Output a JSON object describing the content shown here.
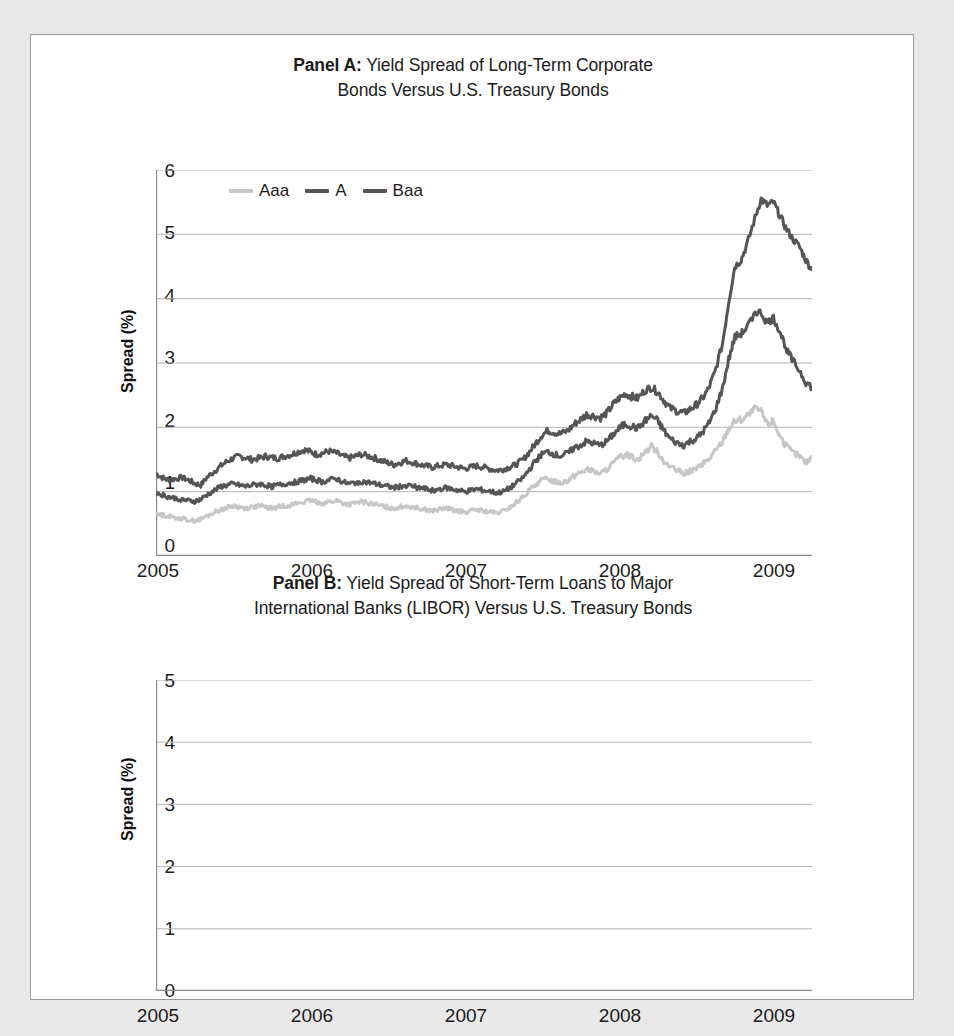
{
  "figure": {
    "background_color": "#e9e9e9",
    "frame_color": "#9a9a9a",
    "axis_color": "#8a8a8a",
    "grid_color": "#b5b5b5"
  },
  "panel_a": {
    "title_bold": "Panel A:",
    "title_rest": " Yield Spread of Long-Term Corporate",
    "title_line2": "Bonds Versus U.S. Treasury Bonds",
    "ylabel": "Spread (%)",
    "yticks": [
      "0",
      "1",
      "2",
      "3",
      "4",
      "5",
      "6"
    ],
    "xticks": [
      "2005",
      "2006",
      "2007",
      "2008",
      "2009"
    ],
    "legend": [
      {
        "label": "Aaa",
        "color": "#c7c7c7"
      },
      {
        "label": "A",
        "color": "#555555"
      },
      {
        "label": "Baa",
        "color": "#555555"
      }
    ]
  },
  "panel_b": {
    "title_bold": "Panel B:",
    "title_rest": " Yield Spread of Short-Term Loans to Major",
    "title_line2": "International Banks (LIBOR) Versus U.S. Treasury Bonds",
    "ylabel": "Spread (%)",
    "yticks": [
      "0",
      "1",
      "2",
      "3",
      "4",
      "5"
    ],
    "xticks": [
      "2005",
      "2006",
      "2007",
      "2008",
      "2009"
    ]
  },
  "chart_data": [
    {
      "type": "line",
      "id": "panel-a",
      "title": "Panel A: Yield Spread of Long-Term Corporate Bonds Versus U.S. Treasury Bonds",
      "xlabel": "",
      "ylabel": "Spread (%)",
      "xlim": [
        2005.0,
        2009.25
      ],
      "ylim": [
        0,
        6
      ],
      "ytick_values": [
        0,
        1,
        2,
        3,
        4,
        5,
        6
      ],
      "xtick_values": [
        2005,
        2006,
        2007,
        2008,
        2009
      ],
      "grid": "horizontal",
      "legend_position": "top-left-inside",
      "x": [
        2005.0,
        2005.04,
        2005.08,
        2005.12,
        2005.17,
        2005.21,
        2005.25,
        2005.29,
        2005.33,
        2005.38,
        2005.42,
        2005.46,
        2005.5,
        2005.54,
        2005.58,
        2005.62,
        2005.67,
        2005.71,
        2005.75,
        2005.79,
        2005.83,
        2005.88,
        2005.92,
        2005.96,
        2006.0,
        2006.04,
        2006.08,
        2006.12,
        2006.17,
        2006.21,
        2006.25,
        2006.29,
        2006.33,
        2006.38,
        2006.42,
        2006.46,
        2006.5,
        2006.54,
        2006.58,
        2006.62,
        2006.67,
        2006.71,
        2006.75,
        2006.79,
        2006.83,
        2006.88,
        2006.92,
        2006.96,
        2007.0,
        2007.04,
        2007.08,
        2007.12,
        2007.17,
        2007.21,
        2007.25,
        2007.29,
        2007.33,
        2007.38,
        2007.42,
        2007.46,
        2007.5,
        2007.54,
        2007.58,
        2007.62,
        2007.67,
        2007.71,
        2007.75,
        2007.79,
        2007.83,
        2007.88,
        2007.92,
        2007.96,
        2008.0,
        2008.04,
        2008.08,
        2008.12,
        2008.17,
        2008.21,
        2008.25,
        2008.29,
        2008.33,
        2008.38,
        2008.42,
        2008.46,
        2008.5,
        2008.54,
        2008.58,
        2008.62,
        2008.67,
        2008.71,
        2008.75,
        2008.79,
        2008.83,
        2008.88,
        2008.92,
        2008.96,
        2009.0,
        2009.04,
        2009.08,
        2009.12,
        2009.17,
        2009.21,
        2009.25
      ],
      "series": [
        {
          "name": "Baa",
          "color": "#555555",
          "values": [
            1.28,
            1.22,
            1.18,
            1.2,
            1.22,
            1.18,
            1.13,
            1.1,
            1.22,
            1.32,
            1.4,
            1.47,
            1.52,
            1.55,
            1.53,
            1.5,
            1.52,
            1.55,
            1.53,
            1.52,
            1.55,
            1.58,
            1.62,
            1.65,
            1.62,
            1.58,
            1.6,
            1.63,
            1.6,
            1.55,
            1.52,
            1.55,
            1.58,
            1.55,
            1.52,
            1.48,
            1.45,
            1.42,
            1.45,
            1.48,
            1.45,
            1.42,
            1.4,
            1.38,
            1.4,
            1.42,
            1.4,
            1.38,
            1.36,
            1.38,
            1.4,
            1.38,
            1.35,
            1.33,
            1.35,
            1.38,
            1.42,
            1.5,
            1.62,
            1.75,
            1.88,
            1.95,
            1.92,
            1.9,
            1.95,
            2.05,
            2.12,
            2.2,
            2.18,
            2.15,
            2.22,
            2.35,
            2.45,
            2.52,
            2.48,
            2.45,
            2.58,
            2.62,
            2.55,
            2.42,
            2.3,
            2.25,
            2.22,
            2.28,
            2.35,
            2.45,
            2.6,
            2.85,
            3.3,
            3.95,
            4.5,
            4.6,
            4.85,
            5.25,
            5.55,
            5.45,
            5.5,
            5.3,
            5.1,
            4.95,
            4.8,
            4.6,
            4.45,
            4.25,
            4.1
          ]
        },
        {
          "name": "A",
          "color": "#555555",
          "values": [
            0.98,
            0.95,
            0.92,
            0.9,
            0.88,
            0.86,
            0.85,
            0.88,
            0.95,
            1.02,
            1.08,
            1.1,
            1.12,
            1.1,
            1.08,
            1.1,
            1.12,
            1.1,
            1.08,
            1.1,
            1.12,
            1.14,
            1.16,
            1.18,
            1.2,
            1.18,
            1.15,
            1.18,
            1.2,
            1.15,
            1.12,
            1.14,
            1.16,
            1.14,
            1.12,
            1.1,
            1.08,
            1.06,
            1.08,
            1.1,
            1.08,
            1.06,
            1.04,
            1.02,
            1.04,
            1.06,
            1.04,
            1.02,
            1.0,
            1.02,
            1.04,
            1.02,
            1.0,
            0.98,
            1.0,
            1.05,
            1.12,
            1.22,
            1.35,
            1.48,
            1.58,
            1.62,
            1.58,
            1.55,
            1.6,
            1.68,
            1.72,
            1.78,
            1.75,
            1.72,
            1.78,
            1.88,
            1.98,
            2.05,
            2.02,
            1.98,
            2.1,
            2.18,
            2.1,
            1.95,
            1.82,
            1.75,
            1.72,
            1.78,
            1.82,
            1.92,
            2.05,
            2.25,
            2.6,
            3.05,
            3.4,
            3.45,
            3.55,
            3.8,
            3.78,
            3.62,
            3.7,
            3.5,
            3.25,
            3.05,
            2.88,
            2.7,
            2.62,
            2.45,
            2.38
          ]
        },
        {
          "name": "Aaa",
          "color": "#c7c7c7",
          "values": [
            0.65,
            0.64,
            0.62,
            0.6,
            0.58,
            0.56,
            0.55,
            0.57,
            0.62,
            0.68,
            0.72,
            0.75,
            0.78,
            0.76,
            0.74,
            0.76,
            0.78,
            0.76,
            0.74,
            0.76,
            0.78,
            0.8,
            0.82,
            0.84,
            0.86,
            0.84,
            0.82,
            0.84,
            0.86,
            0.82,
            0.8,
            0.82,
            0.84,
            0.82,
            0.8,
            0.78,
            0.76,
            0.74,
            0.76,
            0.78,
            0.76,
            0.74,
            0.72,
            0.7,
            0.72,
            0.74,
            0.72,
            0.7,
            0.68,
            0.7,
            0.72,
            0.7,
            0.68,
            0.66,
            0.7,
            0.75,
            0.82,
            0.92,
            1.02,
            1.12,
            1.18,
            1.2,
            1.16,
            1.14,
            1.18,
            1.25,
            1.3,
            1.35,
            1.32,
            1.28,
            1.34,
            1.44,
            1.52,
            1.58,
            1.55,
            1.5,
            1.62,
            1.7,
            1.62,
            1.48,
            1.38,
            1.32,
            1.28,
            1.32,
            1.36,
            1.42,
            1.5,
            1.62,
            1.78,
            1.98,
            2.1,
            2.12,
            2.18,
            2.28,
            2.25,
            2.05,
            2.1,
            1.88,
            1.72,
            1.62,
            1.55,
            1.45,
            1.55,
            1.42,
            1.48
          ]
        }
      ]
    },
    {
      "type": "line",
      "id": "panel-b",
      "title": "Panel B: Yield Spread of Short-Term Loans to Major International Banks (LIBOR) Versus U.S. Treasury Bonds",
      "xlabel": "",
      "ylabel": "Spread (%)",
      "xlim": [
        2005.0,
        2009.25
      ],
      "ylim": [
        0,
        5
      ],
      "ytick_values": [
        0,
        1,
        2,
        3,
        4,
        5
      ],
      "xtick_values": [
        2005,
        2006,
        2007,
        2008,
        2009
      ],
      "grid": "horizontal",
      "series": [
        {
          "name": "LIBOR spread",
          "color": "#555555",
          "values": [
            0.12,
            0.2,
            0.18,
            0.24,
            0.19,
            0.22,
            0.16,
            0.2,
            0.17,
            0.22,
            0.26,
            0.24,
            0.21,
            0.27,
            0.3,
            0.26,
            0.29,
            0.25,
            0.22,
            0.26,
            0.23,
            0.2,
            0.24,
            0.27,
            0.25,
            0.22,
            0.19,
            0.23,
            0.26,
            0.22,
            0.25,
            0.36,
            0.28,
            0.26,
            0.31,
            0.34,
            0.38,
            0.32,
            0.25,
            0.2,
            0.16,
            0.12,
            0.15,
            0.2,
            0.24,
            0.21,
            0.26,
            0.24,
            0.22,
            0.27,
            0.3,
            0.25,
            0.22,
            0.28,
            0.33,
            0.3,
            0.26,
            0.23,
            0.2,
            0.16,
            0.14,
            0.18,
            0.3,
            0.42,
            0.38,
            0.52,
            0.3,
            0.24,
            0.32,
            0.38,
            0.55,
            2.35,
            1.2,
            1.05,
            1.45,
            1.3,
            1.75,
            2.1,
            2.15,
            1.95,
            1.6,
            1.2,
            1.0,
            1.25,
            1.55,
            1.3,
            1.05,
            0.95,
            1.0,
            1.15,
            1.1,
            1.45,
            3.15,
            3.9,
            4.65,
            3.5,
            2.2,
            1.55,
            2.15,
            1.95,
            1.3,
            0.95,
            0.8,
            0.9,
            1.02
          ]
        }
      ]
    }
  ]
}
